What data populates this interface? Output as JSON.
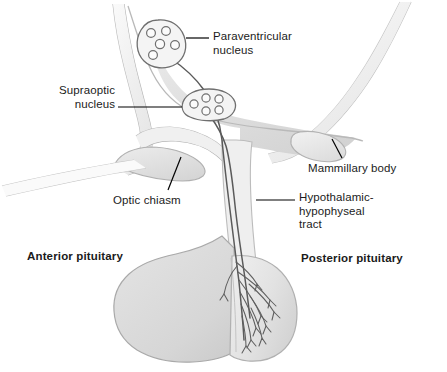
{
  "figure": {
    "width": 447,
    "height": 372,
    "background": "#ffffff"
  },
  "labels": {
    "paraventricular_nucleus": "Paraventricular\nnucleus",
    "supraoptic_nucleus": "Supraoptic\nnucleus",
    "optic_chiasm": "Optic chiasm",
    "mammillary_body": "Mammillary body",
    "hypothalamic_hypophyseal_tract": "Hypothalamic-\nhypophyseal\ntract",
    "anterior_pituitary": "Anterior pituitary",
    "posterior_pituitary": "Posterior pituitary"
  },
  "colors": {
    "text": "#1b1b1b",
    "leader_line": "#000000",
    "outline": "#6f6f6f",
    "outline_light": "#b4b4b4",
    "tissue_fill": "#e4e4e4",
    "tissue_fill_dark": "#d6d6d6",
    "tissue_fill_light": "#f2f2f2",
    "nerve_tract": "#555555",
    "background": "#ffffff"
  },
  "structures": [
    {
      "name": "paraventricular-nucleus",
      "vesicle_count": 5
    },
    {
      "name": "supraoptic-nucleus",
      "vesicle_count": 5
    },
    {
      "name": "optic-chiasm",
      "vesicle_count": 0
    },
    {
      "name": "mammillary-body",
      "vesicle_count": 0
    },
    {
      "name": "infundibulum-stalk",
      "vesicle_count": 0
    },
    {
      "name": "anterior-pituitary-lobe",
      "vesicle_count": 0
    },
    {
      "name": "posterior-pituitary-lobe",
      "vesicle_count": 0
    }
  ]
}
